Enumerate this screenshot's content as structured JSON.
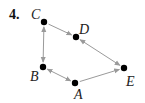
{
  "problem_number": "4.",
  "nodes": [
    {
      "id": "C",
      "label": "C",
      "x": 44,
      "y": 22,
      "lx": 31,
      "ly": 19
    },
    {
      "id": "D",
      "label": "D",
      "x": 76,
      "y": 37,
      "lx": 79,
      "ly": 34
    },
    {
      "id": "B",
      "label": "B",
      "x": 43,
      "y": 67,
      "lx": 30,
      "ly": 81
    },
    {
      "id": "A",
      "label": "A",
      "x": 75,
      "y": 83,
      "lx": 74,
      "ly": 99
    },
    {
      "id": "E",
      "label": "E",
      "x": 124,
      "y": 68,
      "lx": 126,
      "ly": 86
    }
  ],
  "edges": [
    {
      "from": "C",
      "to": "D",
      "direction": "forward"
    },
    {
      "from": "C",
      "to": "B",
      "direction": "both"
    },
    {
      "from": "B",
      "to": "A",
      "direction": "both"
    },
    {
      "from": "D",
      "to": "E",
      "direction": "both"
    },
    {
      "from": "A",
      "to": "E",
      "direction": "forward"
    }
  ],
  "colors": {
    "node": "#000000",
    "edge": "#9a9a9a",
    "background": "#ffffff"
  }
}
